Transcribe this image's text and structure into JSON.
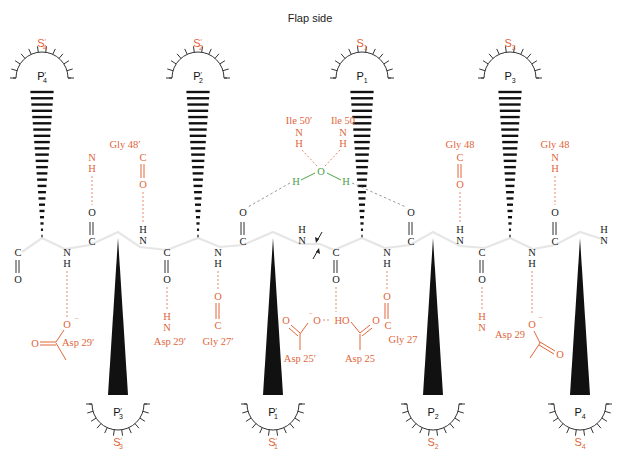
{
  "title": "Flap side",
  "colors": {
    "enzyme_residue": "#e0663a",
    "water": "#4aa24a",
    "substrate": "#222222"
  },
  "top_pockets": [
    {
      "id": "S4p",
      "s_main": "S",
      "s_sub": "4",
      "s_prime": true,
      "p_main": "P",
      "p_sub": "4",
      "p_prime": true
    },
    {
      "id": "S2p",
      "s_main": "S",
      "s_sub": "2",
      "s_prime": true,
      "p_main": "P",
      "p_sub": "2",
      "p_prime": true
    },
    {
      "id": "S1",
      "s_main": "S",
      "s_sub": "1",
      "s_prime": false,
      "p_main": "P",
      "p_sub": "1",
      "p_prime": false
    },
    {
      "id": "S3",
      "s_main": "S",
      "s_sub": "3",
      "s_prime": false,
      "p_main": "P",
      "p_sub": "3",
      "p_prime": false
    }
  ],
  "bottom_pockets": [
    {
      "id": "S3p",
      "s_main": "S",
      "s_sub": "3",
      "s_prime": true,
      "p_main": "P",
      "p_sub": "3",
      "p_prime": true
    },
    {
      "id": "S1p",
      "s_main": "S",
      "s_sub": "1",
      "s_prime": true,
      "p_main": "P",
      "p_sub": "1",
      "p_prime": true
    },
    {
      "id": "S2",
      "s_main": "S",
      "s_sub": "2",
      "s_prime": false,
      "p_main": "P",
      "p_sub": "2",
      "p_prime": false
    },
    {
      "id": "S4",
      "s_main": "S",
      "s_sub": "4",
      "s_prime": false,
      "p_main": "P",
      "p_sub": "4",
      "p_prime": false
    }
  ],
  "prime_mark": "′",
  "atoms": {
    "C": "C",
    "O": "O",
    "N": "N",
    "H": "H",
    "O_minus": "O",
    "minus": "−",
    "HO": "HO"
  },
  "residues": {
    "gly48p": "Gly 48′",
    "ile50p": "Ile 50′",
    "ile50": "Ile 50",
    "gly48_a": "Gly 48",
    "gly48_b": "Gly 48",
    "asp29p_a": "Asp 29′",
    "asp29p_b": "Asp 29′",
    "gly27p": "Gly 27′",
    "asp25p": "Asp 25′",
    "asp25": "Asp 25",
    "gly27": "Gly 27",
    "asp29": "Asp 29"
  },
  "cleavage_site": "scissile-bond-arrows"
}
